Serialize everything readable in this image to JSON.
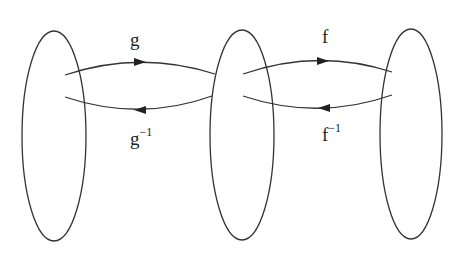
{
  "diagram": {
    "sets": [
      {
        "id": "set-1",
        "cx": 54,
        "cy": 136,
        "rx": 32,
        "ry": 105
      },
      {
        "id": "set-2",
        "cx": 242,
        "cy": 135,
        "rx": 32,
        "ry": 105
      },
      {
        "id": "set-3",
        "cx": 411,
        "cy": 134,
        "rx": 31,
        "ry": 105
      }
    ],
    "arrows": [
      {
        "id": "g",
        "from": "set-1",
        "to": "set-2",
        "label": "g",
        "direction": "right"
      },
      {
        "id": "g-inverse",
        "from": "set-2",
        "to": "set-1",
        "label": "g",
        "superscript": "−1",
        "direction": "left"
      },
      {
        "id": "f",
        "from": "set-2",
        "to": "set-3",
        "label": "f",
        "direction": "right"
      },
      {
        "id": "f-inverse",
        "from": "set-3",
        "to": "set-2",
        "label": "f",
        "superscript": "−1",
        "direction": "left"
      }
    ],
    "stroke_color": "#333333"
  }
}
